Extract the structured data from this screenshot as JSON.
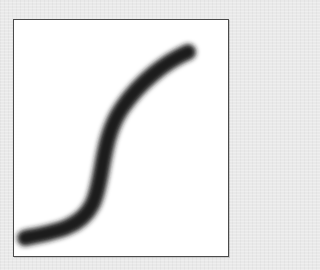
{
  "figure": {
    "stroke": {
      "shape": "s-curve",
      "color": "#1a1a1a",
      "width_px": 16,
      "blur_px": 3,
      "path": "M 25 238 C 55 232, 80 228, 92 205 C 104 182, 100 140, 122 108 C 140 82, 165 62, 188 52"
    },
    "frame": {
      "background": "#ffffff",
      "border_color": "#4a4a4a"
    },
    "page_background": "#e9e9e9"
  }
}
